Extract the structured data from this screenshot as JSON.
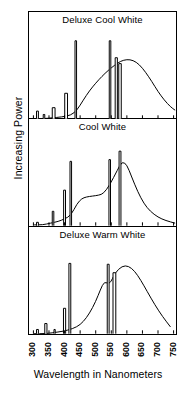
{
  "figure": {
    "ylabel": "Increasing Power",
    "xlabel": "Wavelength in Nanometers",
    "line_color": "#000000",
    "background": "#ffffff"
  },
  "chart_data": {
    "type": "line",
    "title": "",
    "xlabel": "Wavelength in Nanometers",
    "ylabel": "Increasing Power",
    "xlim": [
      290,
      760
    ],
    "ylim": [
      0,
      100
    ],
    "grid": false,
    "legend": "none",
    "xticks": [
      300,
      350,
      400,
      450,
      500,
      550,
      600,
      650,
      700,
      750
    ],
    "xtick_labels": [
      "300",
      "350",
      "400",
      "450",
      "500",
      "550",
      "600",
      "650",
      "700",
      "750"
    ],
    "yticks": [],
    "ytick_labels": [],
    "panels": [
      {
        "title": "Deluxe Cool White",
        "continuum": [
          {
            "x": 300,
            "y": 0
          },
          {
            "x": 330,
            "y": 0
          },
          {
            "x": 360,
            "y": 1
          },
          {
            "x": 390,
            "y": 2
          },
          {
            "x": 420,
            "y": 4
          },
          {
            "x": 440,
            "y": 10
          },
          {
            "x": 460,
            "y": 22
          },
          {
            "x": 480,
            "y": 33
          },
          {
            "x": 500,
            "y": 42
          },
          {
            "x": 520,
            "y": 50
          },
          {
            "x": 540,
            "y": 57
          },
          {
            "x": 560,
            "y": 63
          },
          {
            "x": 580,
            "y": 68
          },
          {
            "x": 600,
            "y": 70
          },
          {
            "x": 620,
            "y": 69
          },
          {
            "x": 640,
            "y": 64
          },
          {
            "x": 660,
            "y": 55
          },
          {
            "x": 680,
            "y": 44
          },
          {
            "x": 700,
            "y": 32
          },
          {
            "x": 720,
            "y": 22
          },
          {
            "x": 740,
            "y": 14
          },
          {
            "x": 755,
            "y": 10
          }
        ],
        "spikes": [
          {
            "x": 313,
            "width": 6,
            "height": 9
          },
          {
            "x": 334,
            "width": 5,
            "height": 5
          },
          {
            "x": 365,
            "width": 9,
            "height": 13
          },
          {
            "x": 405,
            "width": 9,
            "height": 30
          },
          {
            "x": 436,
            "width": 5,
            "height": 92
          },
          {
            "x": 546,
            "width": 5,
            "height": 92
          },
          {
            "x": 566,
            "width": 7,
            "height": 72
          },
          {
            "x": 578,
            "width": 8,
            "height": 65
          }
        ]
      },
      {
        "title": "Cool White",
        "continuum": [
          {
            "x": 300,
            "y": 1
          },
          {
            "x": 330,
            "y": 1
          },
          {
            "x": 355,
            "y": 3
          },
          {
            "x": 380,
            "y": 5
          },
          {
            "x": 400,
            "y": 8
          },
          {
            "x": 420,
            "y": 12
          },
          {
            "x": 440,
            "y": 26
          },
          {
            "x": 455,
            "y": 32
          },
          {
            "x": 470,
            "y": 34
          },
          {
            "x": 490,
            "y": 35
          },
          {
            "x": 510,
            "y": 36
          },
          {
            "x": 525,
            "y": 38
          },
          {
            "x": 545,
            "y": 48
          },
          {
            "x": 570,
            "y": 66
          },
          {
            "x": 585,
            "y": 76
          },
          {
            "x": 600,
            "y": 72
          },
          {
            "x": 615,
            "y": 58
          },
          {
            "x": 635,
            "y": 40
          },
          {
            "x": 655,
            "y": 26
          },
          {
            "x": 675,
            "y": 17
          },
          {
            "x": 700,
            "y": 10
          },
          {
            "x": 725,
            "y": 6
          },
          {
            "x": 755,
            "y": 3
          }
        ],
        "spikes": [
          {
            "x": 313,
            "width": 6,
            "height": 4
          },
          {
            "x": 363,
            "width": 5,
            "height": 17
          },
          {
            "x": 400,
            "width": 6,
            "height": 42
          },
          {
            "x": 420,
            "width": 5,
            "height": 76
          },
          {
            "x": 545,
            "width": 5,
            "height": 78
          },
          {
            "x": 578,
            "width": 6,
            "height": 88
          }
        ]
      },
      {
        "title": "Deluxe Warm White",
        "continuum": [
          {
            "x": 300,
            "y": 0
          },
          {
            "x": 340,
            "y": 0
          },
          {
            "x": 380,
            "y": 2
          },
          {
            "x": 410,
            "y": 4
          },
          {
            "x": 440,
            "y": 8
          },
          {
            "x": 460,
            "y": 14
          },
          {
            "x": 480,
            "y": 24
          },
          {
            "x": 500,
            "y": 38
          },
          {
            "x": 515,
            "y": 52
          },
          {
            "x": 528,
            "y": 62
          },
          {
            "x": 545,
            "y": 58
          },
          {
            "x": 562,
            "y": 72
          },
          {
            "x": 585,
            "y": 80
          },
          {
            "x": 605,
            "y": 80
          },
          {
            "x": 625,
            "y": 74
          },
          {
            "x": 645,
            "y": 63
          },
          {
            "x": 665,
            "y": 50
          },
          {
            "x": 690,
            "y": 34
          },
          {
            "x": 715,
            "y": 20
          },
          {
            "x": 740,
            "y": 8
          }
        ],
        "spikes": [
          {
            "x": 313,
            "width": 6,
            "height": 5
          },
          {
            "x": 340,
            "width": 7,
            "height": 12
          },
          {
            "x": 368,
            "width": 4,
            "height": 5
          },
          {
            "x": 400,
            "width": 7,
            "height": 30
          },
          {
            "x": 417,
            "width": 6,
            "height": 83
          },
          {
            "x": 540,
            "width": 6,
            "height": 82
          },
          {
            "x": 560,
            "width": 9,
            "height": 72
          }
        ]
      }
    ]
  }
}
